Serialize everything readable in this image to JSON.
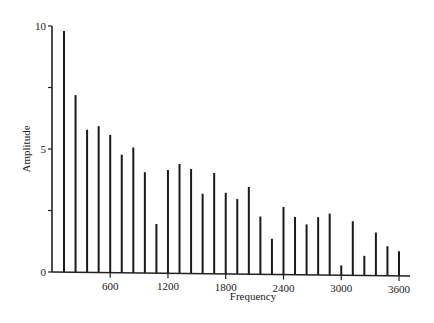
{
  "chart_data": {
    "type": "bar",
    "title": "",
    "xlabel": "Frequency",
    "ylabel": "Amplitude",
    "ylim": [
      0,
      10
    ],
    "xlim": [
      0,
      3720
    ],
    "grid": false,
    "legend": null,
    "y_ticks": [
      {
        "value": 0,
        "label": "0"
      },
      {
        "value": 2.5,
        "label": ""
      },
      {
        "value": 5,
        "label": "5"
      },
      {
        "value": 7.5,
        "label": ""
      },
      {
        "value": 10,
        "label": "10"
      }
    ],
    "x_ticks": [
      {
        "value": 600,
        "label": "600"
      },
      {
        "value": 1200,
        "label": "1200"
      },
      {
        "value": 1800,
        "label": "1800"
      },
      {
        "value": 2400,
        "label": "2400"
      },
      {
        "value": 3000,
        "label": "3000"
      },
      {
        "value": 3600,
        "label": "3600"
      }
    ],
    "x": [
      120,
      240,
      360,
      480,
      600,
      720,
      840,
      960,
      1080,
      1200,
      1320,
      1440,
      1560,
      1680,
      1800,
      1920,
      2040,
      2160,
      2280,
      2400,
      2520,
      2640,
      2760,
      2880,
      3000,
      3120,
      3240,
      3360,
      3480,
      3600
    ],
    "values": [
      9.8,
      7.2,
      5.8,
      5.95,
      5.6,
      4.8,
      5.1,
      4.1,
      2.0,
      4.2,
      4.45,
      4.25,
      3.25,
      4.1,
      3.3,
      3.05,
      3.55,
      2.35,
      1.45,
      2.75,
      2.35,
      2.05,
      2.35,
      2.5,
      0.4,
      2.2,
      0.8,
      1.75,
      1.2,
      1.0
    ]
  }
}
